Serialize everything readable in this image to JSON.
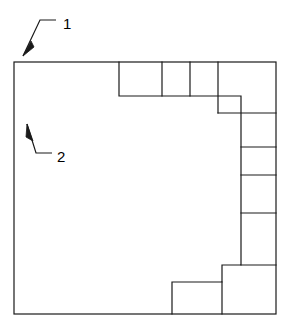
{
  "figure": {
    "type": "technical-line-drawing",
    "background_color": "#ffffff",
    "line_color": "#1a1a1a",
    "line_width": 1.2,
    "canvas": {
      "width": 290,
      "height": 332
    }
  },
  "callouts": [
    {
      "id": "callout-1",
      "label": "1",
      "label_x": 63,
      "label_y": 25,
      "leader": "M 56 20 L 40 20 L 23 56",
      "arrow": "M 23 56 L 31 41 L 34 47 Z",
      "points_to": "outer-frame-top-left-corner"
    },
    {
      "id": "callout-2",
      "label": "2",
      "label_x": 57,
      "label_y": 158,
      "leader": "M 52 153 L 36 153 L 27 124",
      "arrow": "M 27 124 L 33 140 L 27 138 Z",
      "points_to": "substrate-body"
    }
  ],
  "outer_frame": {
    "name": "outer-frame",
    "x1": 14,
    "y1": 62,
    "x2": 276,
    "y2": 314
  },
  "inner_void": {
    "name": "inner-void-boundary",
    "path": "M 119 62 L 119 96 L 241 96 L 241 265 L 222 265 L 222 282 L 172 282 L 172 314"
  },
  "top_cells": [
    {
      "name": "top-cell-1",
      "x1": 119,
      "y1": 62,
      "x2": 162,
      "y2": 96
    },
    {
      "name": "top-cell-2",
      "x1": 162,
      "y1": 62,
      "x2": 190,
      "y2": 96
    },
    {
      "name": "top-cell-3",
      "x1": 190,
      "y1": 62,
      "x2": 218,
      "y2": 96
    },
    {
      "name": "corner-cell",
      "x1": 218,
      "y1": 62,
      "x2": 276,
      "y2": 113
    }
  ],
  "right_cells": [
    {
      "name": "right-cell-1",
      "x1": 241,
      "y1": 113,
      "x2": 276,
      "y2": 147
    },
    {
      "name": "right-cell-2",
      "x1": 241,
      "y1": 147,
      "x2": 276,
      "y2": 175
    },
    {
      "name": "right-cell-3",
      "x1": 241,
      "y1": 175,
      "x2": 276,
      "y2": 213
    },
    {
      "name": "right-cell-4",
      "x1": 241,
      "y1": 213,
      "x2": 276,
      "y2": 265
    }
  ],
  "bottom_cells": [
    {
      "name": "bottom-cell-1",
      "x1": 172,
      "y1": 282,
      "x2": 222,
      "y2": 314
    },
    {
      "name": "bottom-cell-2",
      "x1": 222,
      "y1": 265,
      "x2": 276,
      "y2": 314
    }
  ],
  "divider_lines": {
    "vertical": [
      {
        "name": "divider-v-x119",
        "x": 119,
        "y1": 62,
        "y2": 96
      },
      {
        "name": "divider-v-x162",
        "x": 162,
        "y1": 62,
        "y2": 96
      },
      {
        "name": "divider-v-x190",
        "x": 190,
        "y1": 62,
        "y2": 96
      },
      {
        "name": "divider-v-x218",
        "x": 218,
        "y1": 62,
        "y2": 96
      },
      {
        "name": "divider-v-x241-top",
        "x": 241,
        "y1": 96,
        "y2": 113
      },
      {
        "name": "divider-v-x222-bottom",
        "x": 222,
        "y1": 282,
        "y2": 314
      }
    ],
    "horizontal": [
      {
        "name": "divider-h-y113",
        "y": 113,
        "x1": 241,
        "x2": 276
      },
      {
        "name": "divider-h-y147",
        "y": 147,
        "x1": 241,
        "x2": 276
      },
      {
        "name": "divider-h-y175",
        "y": 175,
        "x1": 241,
        "x2": 276
      },
      {
        "name": "divider-h-y213",
        "y": 213,
        "x1": 241,
        "x2": 276
      },
      {
        "name": "divider-h-y265",
        "y": 265,
        "x1": 241,
        "x2": 276
      }
    ]
  }
}
